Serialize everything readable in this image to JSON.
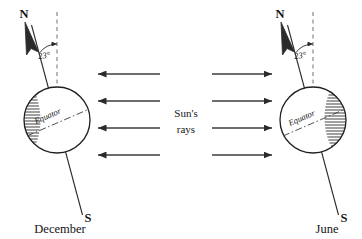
{
  "figure": {
    "background_color": "#ffffff",
    "ink_color": "#141414",
    "width": 362,
    "height": 239
  },
  "center_annotation": {
    "line1": "Sun's",
    "line2": "rays"
  },
  "globes": [
    {
      "id": "december-globe",
      "season_label": "December",
      "north_pole_label": "N",
      "south_pole_label": "S",
      "tilt_label": "23°",
      "equator_label": "Equator",
      "tilt_degrees": 23,
      "shaded_side": "left",
      "center": {
        "x": 57,
        "y": 120
      },
      "radius": 33
    },
    {
      "id": "june-globe",
      "season_label": "June",
      "north_pole_label": "N",
      "south_pole_label": "S",
      "tilt_label": "23°",
      "equator_label": "Equator",
      "tilt_degrees": 23,
      "shaded_side": "right",
      "center": {
        "x": 313,
        "y": 120
      },
      "radius": 33
    }
  ],
  "sun_rays": {
    "left_group_direction": "left",
    "right_group_direction": "right",
    "count_per_group": 4,
    "row_y_positions": [
      74,
      101,
      128,
      155
    ]
  }
}
